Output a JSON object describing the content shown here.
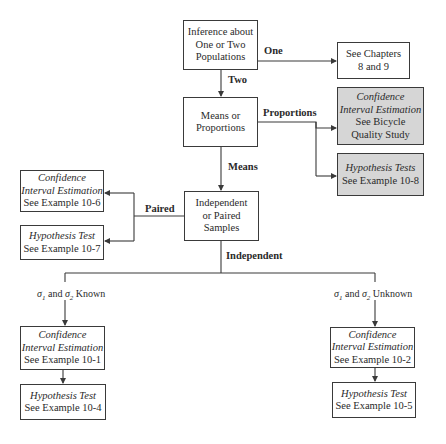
{
  "diagram": {
    "nodes": {
      "root": {
        "lines": [
          "Inference about",
          "One or Two",
          "Populations"
        ]
      },
      "chapters": {
        "lines": [
          "See Chapters",
          "8 and 9"
        ]
      },
      "means_props": {
        "lines": [
          "Means or",
          "Proportions"
        ]
      },
      "prop_ci": {
        "italic": [
          "Confidence",
          "Interval Estimation"
        ],
        "lines": [
          "See Bicycle",
          "Quality Study"
        ]
      },
      "prop_ht": {
        "italic": [
          "Hypothesis Tests"
        ],
        "lines": [
          "See Example 10-8"
        ]
      },
      "indep_paired": {
        "lines": [
          "Independent",
          "or Paired",
          "Samples"
        ]
      },
      "paired_ci": {
        "italic": [
          "Confidence",
          "Interval Estimation"
        ],
        "lines": [
          "See Example 10-6"
        ]
      },
      "paired_ht": {
        "italic": [
          "Hypothesis Test"
        ],
        "lines": [
          "See Example 10-7"
        ]
      },
      "known_ci": {
        "italic": [
          "Confidence",
          "Interval Estimation"
        ],
        "lines": [
          "See Example 10-1"
        ]
      },
      "known_ht": {
        "italic": [
          "Hypothesis Test"
        ],
        "lines": [
          "See Example 10-4"
        ]
      },
      "unknown_ci": {
        "italic": [
          "Confidence",
          "Interval Estimation"
        ],
        "lines": [
          "See Example 10-2"
        ]
      },
      "unknown_ht": {
        "italic": [
          "Hypothesis Test"
        ],
        "lines": [
          "See Example 10-5"
        ]
      }
    },
    "edge_labels": {
      "one": "One",
      "two": "Two",
      "proportions": "Proportions",
      "means": "Means",
      "paired": "Paired",
      "independent": "Independent"
    },
    "sigma_labels": {
      "known": {
        "sym": "σ",
        "s1": "1",
        "and": " and ",
        "s2": "2",
        "suffix": " Known"
      },
      "unknown": {
        "sym": "σ",
        "s1": "1",
        "and": " and ",
        "s2": "2",
        "suffix": " Unknown"
      }
    },
    "colors": {
      "highlight_fill": "#d6d6d6",
      "line": "#3a3a3a"
    }
  }
}
